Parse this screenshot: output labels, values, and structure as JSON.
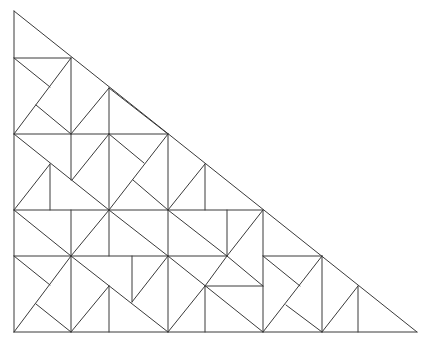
{
  "diagram": {
    "type": "triangle-dissection",
    "stroke_color": "#3a3a3a",
    "background": "#ffffff",
    "outline": [
      [
        14,
        11
      ],
      [
        14,
        332
      ],
      [
        417,
        332
      ]
    ],
    "segments": [
      [
        14,
        11,
        14,
        332
      ],
      [
        14,
        332,
        417,
        332
      ],
      [
        14,
        11,
        417,
        332
      ],
      [
        14,
        58,
        71,
        58
      ],
      [
        71,
        58,
        71,
        134
      ],
      [
        14,
        58,
        50,
        87
      ],
      [
        14,
        134,
        71,
        58
      ],
      [
        36,
        105,
        71,
        134
      ],
      [
        14,
        134,
        168,
        134
      ],
      [
        109,
        88,
        109,
        134
      ],
      [
        71,
        134,
        109,
        88
      ],
      [
        109,
        88,
        168,
        134
      ],
      [
        168,
        134,
        168,
        210
      ],
      [
        109,
        134,
        144,
        163
      ],
      [
        109,
        210,
        168,
        134
      ],
      [
        133,
        180,
        168,
        210
      ],
      [
        14,
        134,
        109,
        210
      ],
      [
        50,
        164,
        50,
        210
      ],
      [
        14,
        210,
        50,
        164
      ],
      [
        71,
        134,
        71,
        180
      ],
      [
        72,
        180,
        109,
        134
      ],
      [
        109,
        134,
        109,
        210
      ],
      [
        168,
        210,
        205,
        164
      ],
      [
        205,
        164,
        205,
        210
      ],
      [
        14,
        210,
        263,
        210
      ],
      [
        14,
        210,
        71,
        256
      ],
      [
        71,
        210,
        71,
        256
      ],
      [
        71,
        256,
        109,
        210
      ],
      [
        109,
        210,
        168,
        256
      ],
      [
        109,
        210,
        109,
        256
      ],
      [
        168,
        210,
        168,
        256
      ],
      [
        168,
        210,
        227,
        256
      ],
      [
        227,
        210,
        227,
        256
      ],
      [
        227,
        256,
        263,
        210
      ],
      [
        263,
        210,
        263,
        332
      ],
      [
        14,
        256,
        227,
        256
      ],
      [
        263,
        256,
        322,
        256
      ],
      [
        14,
        256,
        50,
        285
      ],
      [
        14,
        332,
        71,
        256
      ],
      [
        36,
        304,
        71,
        332
      ],
      [
        71,
        256,
        71,
        332
      ],
      [
        71,
        256,
        168,
        332
      ],
      [
        109,
        286,
        109,
        332
      ],
      [
        71,
        332,
        109,
        286
      ],
      [
        132,
        256,
        132,
        302
      ],
      [
        132,
        302,
        168,
        256
      ],
      [
        168,
        256,
        168,
        332
      ],
      [
        168,
        256,
        263,
        332
      ],
      [
        168,
        332,
        205,
        286
      ],
      [
        205,
        286,
        205,
        332
      ],
      [
        205,
        286,
        263,
        286
      ],
      [
        205,
        286,
        227,
        256
      ],
      [
        227,
        256,
        263,
        286
      ],
      [
        263,
        256,
        300,
        286
      ],
      [
        263,
        332,
        322,
        256
      ],
      [
        286,
        305,
        322,
        332
      ],
      [
        322,
        256,
        322,
        332
      ],
      [
        322,
        332,
        358,
        286
      ],
      [
        358,
        286,
        358,
        332
      ]
    ]
  }
}
